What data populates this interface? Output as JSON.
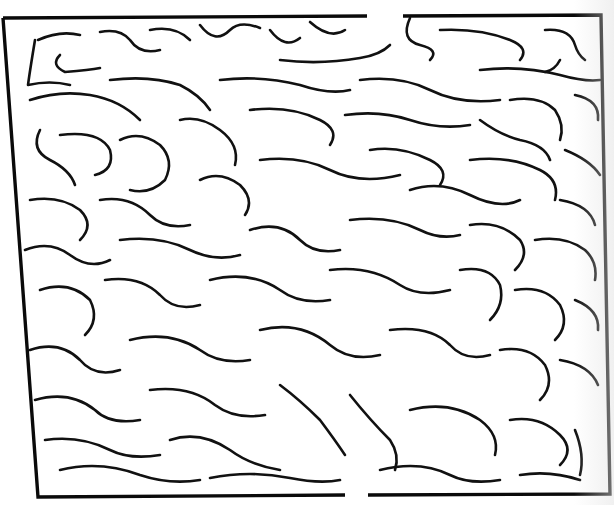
{
  "colors": {
    "ink": "#111111",
    "paper": "#ffffff"
  },
  "entrance": {
    "position": "top",
    "gap_x": [
      367,
      403
    ],
    "y": 16
  },
  "exit": {
    "position": "bottom",
    "gap_x": [
      345,
      368
    ],
    "y": 495
  },
  "border": {
    "top_left": [
      3,
      18
    ],
    "top_right": [
      601,
      15
    ],
    "bottom_right": [
      610,
      494
    ],
    "bottom_left": [
      38,
      497
    ]
  },
  "border_paths": [
    "M3 18 L367 16",
    "M403 16 L601 15 L610 494 L368 495",
    "M345 495 L38 497 L3 18"
  ],
  "wall_paths": [
    "M35 40 Q30 70 28 85 Q50 80 70 85",
    "M38 40 Q60 30 80 35",
    "M60 55 Q50 65 65 72 Q90 70 100 68",
    "M100 32 Q120 28 130 40 Q140 55 160 50",
    "M150 30 Q175 25 190 40",
    "M200 25 Q215 45 230 30 Q240 20 260 28",
    "M270 30 Q285 50 300 38",
    "M310 22 Q330 40 345 30",
    "M280 60 Q320 65 360 58 Q380 55 390 45",
    "M410 18 Q400 40 420 45 Q440 50 430 60",
    "M440 30 Q480 28 510 40 Q530 48 520 60",
    "M545 30 Q570 28 575 45 Q578 55 585 60",
    "M560 60 Q555 70 545 72",
    "M480 70 Q520 65 560 75 Q585 82 600 80",
    "M30 100 Q60 90 90 95 Q120 100 140 120",
    "M110 80 Q150 75 180 85 Q200 95 210 110",
    "M220 80 Q260 75 300 85 Q330 95 350 90",
    "M360 80 Q400 75 430 90 Q460 105 500 100",
    "M510 100 Q540 95 555 110 Q565 125 560 140",
    "M575 95 Q600 100 598 120",
    "M40 130 Q30 150 50 160 Q70 170 75 185",
    "M60 135 Q100 130 110 150 Q115 170 95 175",
    "M120 140 Q140 130 160 145 Q175 160 165 180 Q150 195 130 190",
    "M180 120 Q200 115 220 130 Q240 145 235 165",
    "M250 110 Q290 105 320 120 Q340 130 330 145",
    "M345 115 Q380 110 410 120 Q440 130 470 125",
    "M480 120 Q500 135 520 140 Q545 145 550 160",
    "M565 150 Q590 160 600 175",
    "M30 200 Q60 195 80 210 Q95 225 80 240",
    "M100 200 Q130 195 150 215 Q165 230 190 225",
    "M200 180 Q220 170 240 185 Q255 200 245 215",
    "M260 160 Q300 155 330 170 Q360 185 400 175",
    "M370 150 Q400 145 430 160 Q450 170 440 185",
    "M410 190 Q440 180 470 195 Q500 210 520 200",
    "M470 160 Q510 155 540 170 Q560 180 555 200",
    "M560 200 Q590 205 595 225",
    "M25 250 Q50 240 70 255 Q90 270 110 260",
    "M120 240 Q160 235 190 250 Q215 262 240 255",
    "M250 230 Q280 220 300 240 Q315 255 340 250",
    "M350 220 Q390 215 420 230 Q440 240 460 235",
    "M470 225 Q500 220 520 240 Q530 255 515 270",
    "M535 240 Q565 235 585 250 Q598 262 595 280",
    "M40 290 Q70 280 90 300 Q100 320 85 335",
    "M105 280 Q140 275 160 295 Q175 312 200 305",
    "M210 280 Q250 270 280 290 Q300 305 330 300",
    "M330 270 Q370 265 400 285 Q420 298 450 290",
    "M460 270 Q490 265 500 285 Q505 305 490 320",
    "M515 290 Q545 285 560 305 Q570 325 555 340",
    "M575 300 Q600 310 598 330",
    "M30 350 Q60 340 80 360 Q95 378 120 370",
    "M130 340 Q170 330 200 350 Q220 365 250 360",
    "M260 330 Q300 320 330 345 Q350 362 380 355",
    "M390 330 Q430 325 450 345 Q465 362 490 355",
    "M500 350 Q530 345 545 365 Q555 385 540 400",
    "M560 360 Q590 365 598 385",
    "M35 400 Q70 390 95 410 Q110 425 140 420",
    "M150 390 Q190 385 215 405 Q235 420 265 415",
    "M280 385 Q300 400 320 420 Q335 440 345 455",
    "M350 395 Q370 420 390 440 Q400 455 395 470",
    "M410 410 Q450 400 480 420 Q500 435 495 455",
    "M510 420 Q540 415 560 435 Q575 450 560 465",
    "M45 440 Q80 435 110 450 Q130 460 160 455",
    "M170 440 Q200 430 230 450 Q250 465 280 470",
    "M60 470 Q100 460 140 475 Q170 485 200 480",
    "M210 478 Q250 470 290 478 Q320 484 340 480",
    "M380 470 Q420 460 450 475 Q470 485 500 480",
    "M520 475 Q550 470 580 480",
    "M575 430 Q585 455 580 475"
  ]
}
